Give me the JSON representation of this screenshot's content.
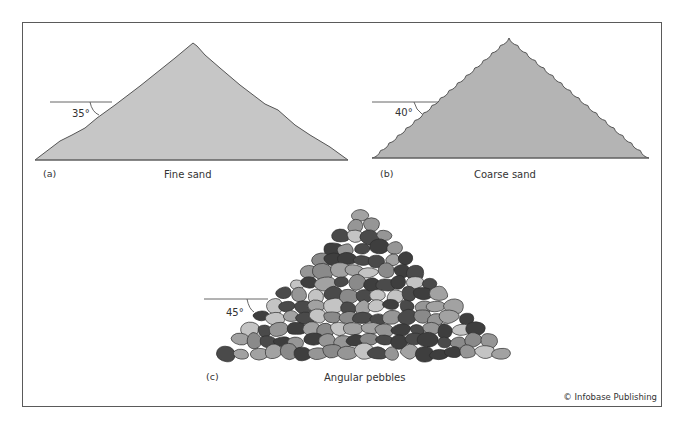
{
  "panels": [
    {
      "id": "a",
      "tag": "(a)",
      "caption": "Fine sand",
      "angle_label": "35°",
      "fill": "#c6c6c6"
    },
    {
      "id": "b",
      "tag": "(b)",
      "caption": "Coarse sand",
      "angle_label": "40°",
      "fill": "#b4b4b4"
    },
    {
      "id": "c",
      "tag": "(c)",
      "caption": "Angular pebbles",
      "angle_label": "45°"
    }
  ],
  "pebble_colors": [
    "#4a4a4a",
    "#8a8a8a",
    "#a2a2a2",
    "#c4c4c4",
    "#3e3e3e",
    "#969696"
  ],
  "credit": "© Infobase Publishing"
}
